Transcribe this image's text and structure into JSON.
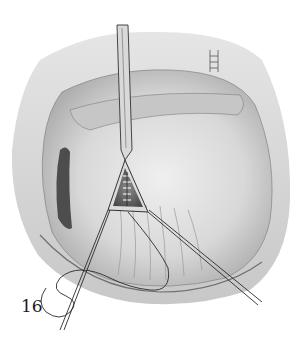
{
  "figure": {
    "label": "16",
    "style": "grayscale pencil drawing"
  },
  "colors": {
    "background": "#ffffff",
    "tissue_light": "#e6e6e6",
    "tissue_mid": "#bdbdbd",
    "tissue_dark": "#555555",
    "line": "#2a2a2a"
  }
}
